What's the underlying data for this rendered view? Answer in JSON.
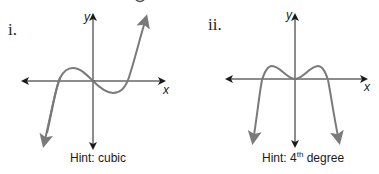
{
  "header_fragment": "g",
  "graphs": [
    {
      "label": "i.",
      "x_axis_label": "x",
      "y_axis_label": "y",
      "hint_prefix": "Hint: cubic",
      "hint_sup": "",
      "hint_suffix": "",
      "curve_type": "cubic"
    },
    {
      "label": "ii.",
      "x_axis_label": "x",
      "y_axis_label": "y",
      "hint_prefix": "Hint: 4",
      "hint_sup": "th",
      "hint_suffix": " degree",
      "curve_type": "quartic"
    }
  ],
  "colors": {
    "axis": "#1a1a1a",
    "curve": "#7a7a7a",
    "text": "#222222"
  }
}
